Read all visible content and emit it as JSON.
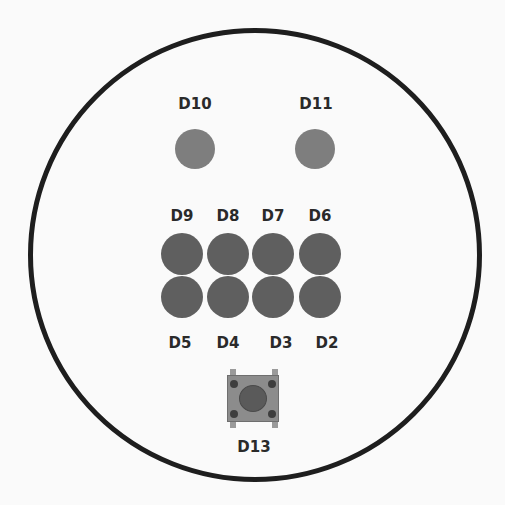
{
  "diagram": {
    "type": "circular-pcb-layout",
    "outline": {
      "shape": "circle",
      "color": "#1e1e1e"
    },
    "top_leds": [
      {
        "id": "D10",
        "label": "D10",
        "color": "#7e7e7e"
      },
      {
        "id": "D11",
        "label": "D11",
        "color": "#7e7e7e"
      }
    ],
    "grid_leds": {
      "row1": [
        {
          "id": "D9",
          "label": "D9",
          "color": "#5f5f5f"
        },
        {
          "id": "D8",
          "label": "D8",
          "color": "#5f5f5f"
        },
        {
          "id": "D7",
          "label": "D7",
          "color": "#5f5f5f"
        },
        {
          "id": "D6",
          "label": "D6",
          "color": "#5f5f5f"
        }
      ],
      "row2": [
        {
          "id": "D5",
          "label": "D5",
          "color": "#5f5f5f"
        },
        {
          "id": "D4",
          "label": "D4",
          "color": "#5f5f5f"
        },
        {
          "id": "D3",
          "label": "D3",
          "color": "#5f5f5f"
        },
        {
          "id": "D2",
          "label": "D2",
          "color": "#5f5f5f"
        }
      ]
    },
    "push_button": {
      "id": "D13",
      "label": "D13",
      "body_color": "#8c8c8c",
      "dome_color": "#5a5a5a"
    }
  }
}
